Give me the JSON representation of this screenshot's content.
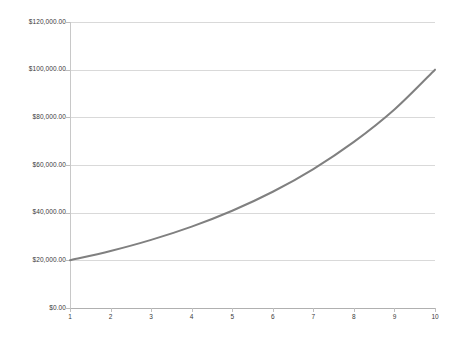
{
  "chart_data": {
    "type": "line",
    "title": "",
    "subtitle": "",
    "xlabel": "",
    "ylabel": "",
    "x": [
      1,
      2,
      3,
      4,
      5,
      6,
      7,
      8,
      9,
      10
    ],
    "categories": [
      "1",
      "2",
      "3",
      "4",
      "5",
      "6",
      "7",
      "8",
      "9",
      "10"
    ],
    "series": [
      {
        "name": "Series 1",
        "color": "#808080",
        "line_width": 2,
        "markers": false,
        "smooth": true,
        "values": [
          20000,
          23905,
          28572,
          34150,
          40816,
          48782,
          58303,
          69681,
          83280,
          100000
        ]
      }
    ],
    "xlim": [
      1,
      10
    ],
    "ylim": [
      0,
      120000
    ],
    "y_ticks": [
      0,
      20000,
      40000,
      60000,
      80000,
      100000,
      120000
    ],
    "y_tick_labels": [
      "$0.00",
      "$20,000.00",
      "$40,000.00",
      "$60,000.00",
      "$80,000.00",
      "$100,000.00",
      "$120,000.00"
    ],
    "x_ticks": [
      1,
      2,
      3,
      4,
      5,
      6,
      7,
      8,
      9,
      10
    ],
    "x_tick_labels": [
      "1",
      "2",
      "3",
      "4",
      "5",
      "6",
      "7",
      "8",
      "9",
      "10"
    ],
    "grid": {
      "horizontal": true,
      "vertical": false,
      "color": "#d9d9d9"
    },
    "legend": {
      "visible": false,
      "position": "none",
      "entries": []
    },
    "annotations": [],
    "background_color": "#ffffff",
    "axis_color": "#c0c0c0",
    "tick_label_color": "#3a3a3a"
  }
}
